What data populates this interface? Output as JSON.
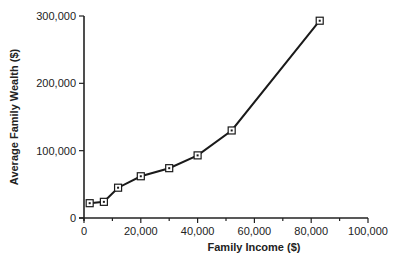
{
  "chart_data": {
    "type": "line",
    "title": "",
    "xlabel": "Family Income ($)",
    "ylabel": "Average Family Wealth ($)",
    "xlim": [
      0,
      100000
    ],
    "ylim": [
      0,
      300000
    ],
    "x_ticks": [
      0,
      20000,
      40000,
      60000,
      80000,
      100000
    ],
    "x_tick_labels": [
      "0",
      "20,000",
      "40,000",
      "60,000",
      "80,000",
      "100,000"
    ],
    "x_minor_ticks": [
      10000,
      30000,
      50000,
      70000,
      90000
    ],
    "y_ticks": [
      0,
      100000,
      200000,
      300000
    ],
    "y_tick_labels": [
      "0",
      "100,000",
      "200,000",
      "300,000"
    ],
    "grid": false,
    "legend": null,
    "series": [
      {
        "name": "Average Family Wealth",
        "marker": "square",
        "x": [
          2000,
          7000,
          12000,
          20000,
          30000,
          40000,
          52000,
          83000
        ],
        "y": [
          22000,
          24000,
          45000,
          62000,
          74000,
          93000,
          130000,
          293000
        ]
      }
    ]
  }
}
